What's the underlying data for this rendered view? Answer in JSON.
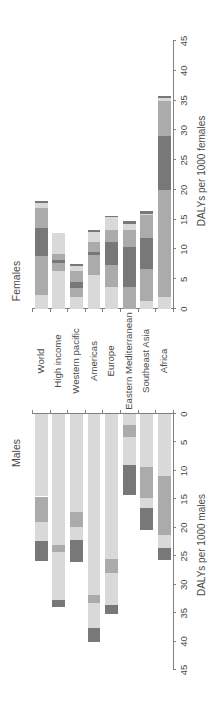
{
  "chart_data": {
    "type": "bar",
    "subtype": "stacked horizontal back-to-back (figure rotated 90 degrees)",
    "categories": [
      "World",
      "High income",
      "Western pacific",
      "Americas",
      "Europe",
      "Eastern Mediterranean",
      "Southeast Asia",
      "Africa"
    ],
    "shade_colors": {
      "light": "#d9d9d9",
      "medium": "#ababab",
      "dark": "#787878"
    },
    "grid": false,
    "legend": null,
    "panels": [
      {
        "name": "Females",
        "xlabel": "DALYs per 1000 females",
        "xlim": [
          0,
          45
        ],
        "ticks": [
          0,
          5,
          10,
          15,
          20,
          25,
          30,
          35,
          40,
          45
        ],
        "bars": [
          {
            "category": "World",
            "total": 18.2,
            "segments": [
              {
                "shade": "light",
                "value": 2.3
              },
              {
                "shade": "medium",
                "value": 6.6
              },
              {
                "shade": "dark",
                "value": 4.7
              },
              {
                "shade": "medium",
                "value": 3.4
              },
              {
                "shade": "light",
                "value": 0.8
              },
              {
                "shade": "dark",
                "value": 0.4
              }
            ]
          },
          {
            "category": "High income",
            "total": 12.7,
            "segments": [
              {
                "shade": "light",
                "value": 6.3
              },
              {
                "shade": "medium",
                "value": 1.5
              },
              {
                "shade": "dark",
                "value": 0.4
              },
              {
                "shade": "medium",
                "value": 1.0
              },
              {
                "shade": "light",
                "value": 3.5
              }
            ]
          },
          {
            "category": "Western pacific",
            "total": 7.55,
            "segments": [
              {
                "shade": "light",
                "value": 2.0
              },
              {
                "shade": "medium",
                "value": 1.5
              },
              {
                "shade": "dark",
                "value": 1.1
              },
              {
                "shade": "medium",
                "value": 1.7
              },
              {
                "shade": "light",
                "value": 0.9
              },
              {
                "shade": "dark",
                "value": 0.35
              }
            ]
          },
          {
            "category": "Americas",
            "total": 13.25,
            "segments": [
              {
                "shade": "light",
                "value": 5.7
              },
              {
                "shade": "medium",
                "value": 3.35
              },
              {
                "shade": "dark",
                "value": 0.45
              },
              {
                "shade": "medium",
                "value": 1.7
              },
              {
                "shade": "light",
                "value": 1.7
              },
              {
                "shade": "dark",
                "value": 0.35
              }
            ]
          },
          {
            "category": "Europe",
            "total": 15.65,
            "segments": [
              {
                "shade": "light",
                "value": 3.75
              },
              {
                "shade": "medium",
                "value": 3.65
              },
              {
                "shade": "dark",
                "value": 3.8
              },
              {
                "shade": "medium",
                "value": 2.1
              },
              {
                "shade": "light",
                "value": 2.1
              },
              {
                "shade": "dark",
                "value": 0.25
              }
            ]
          },
          {
            "category": "Eastern Mediterranean",
            "total": 14.7,
            "segments": [
              {
                "shade": "medium",
                "value": 3.75
              },
              {
                "shade": "dark",
                "value": 6.6
              },
              {
                "shade": "medium",
                "value": 2.9
              },
              {
                "shade": "light",
                "value": 1.0
              },
              {
                "shade": "dark",
                "value": 0.45
              }
            ]
          },
          {
            "category": "Southeast Asia",
            "total": 16.4,
            "segments": [
              {
                "shade": "light",
                "value": 1.4
              },
              {
                "shade": "medium",
                "value": 5.4
              },
              {
                "shade": "dark",
                "value": 5.05
              },
              {
                "shade": "medium",
                "value": 4.0
              },
              {
                "shade": "light",
                "value": 0.15
              },
              {
                "shade": "dark",
                "value": 0.4
              }
            ]
          },
          {
            "category": "Africa",
            "total": 35.7,
            "segments": [
              {
                "shade": "light",
                "value": 2.0
              },
              {
                "shade": "medium",
                "value": 18.0
              },
              {
                "shade": "dark",
                "value": 9.1
              },
              {
                "shade": "medium",
                "value": 5.85
              },
              {
                "shade": "light",
                "value": 0.45
              },
              {
                "shade": "dark",
                "value": 0.3
              }
            ]
          }
        ]
      },
      {
        "name": "Males",
        "xlabel": "DALYs per 1000 males",
        "xlim": [
          0,
          45
        ],
        "ticks": [
          0,
          5,
          10,
          15,
          20,
          25,
          30,
          35,
          40,
          45
        ],
        "bars": [
          {
            "category": "World",
            "total": 25.8,
            "segments": [
              {
                "shade": "light",
                "value": 14.5
              },
              {
                "shade": "medium",
                "value": 4.4
              },
              {
                "shade": "light",
                "value": 3.4
              },
              {
                "shade": "dark",
                "value": 3.5
              }
            ]
          },
          {
            "category": "High income",
            "total": 33.9,
            "segments": [
              {
                "shade": "light",
                "value": 23.0
              },
              {
                "shade": "medium",
                "value": 1.2
              },
              {
                "shade": "light",
                "value": 8.5
              },
              {
                "shade": "dark",
                "value": 1.2
              }
            ]
          },
          {
            "category": "Western pacific",
            "total": 26.1,
            "segments": [
              {
                "shade": "light",
                "value": 17.2
              },
              {
                "shade": "medium",
                "value": 2.7
              },
              {
                "shade": "light",
                "value": 2.2
              },
              {
                "shade": "dark",
                "value": 4.0
              }
            ]
          },
          {
            "category": "Americas",
            "total": 40.1,
            "segments": [
              {
                "shade": "light",
                "value": 31.9
              },
              {
                "shade": "medium",
                "value": 1.4
              },
              {
                "shade": "light",
                "value": 4.3
              },
              {
                "shade": "dark",
                "value": 2.5
              }
            ]
          },
          {
            "category": "Europe",
            "total": 35.2,
            "segments": [
              {
                "shade": "light",
                "value": 25.5
              },
              {
                "shade": "medium",
                "value": 2.5
              },
              {
                "shade": "light",
                "value": 5.5
              },
              {
                "shade": "dark",
                "value": 1.7
              }
            ]
          },
          {
            "category": "Eastern Mediterranean",
            "total": 14.2,
            "segments": [
              {
                "shade": "light",
                "value": 1.9
              },
              {
                "shade": "medium",
                "value": 2.1
              },
              {
                "shade": "light",
                "value": 5.0
              },
              {
                "shade": "dark",
                "value": 5.2
              }
            ]
          },
          {
            "category": "Southeast Asia",
            "total": 20.4,
            "segments": [
              {
                "shade": "light",
                "value": 9.4
              },
              {
                "shade": "medium",
                "value": 5.3
              },
              {
                "shade": "light",
                "value": 1.8
              },
              {
                "shade": "dark",
                "value": 3.9
              }
            ]
          },
          {
            "category": "Africa",
            "total": 25.7,
            "segments": [
              {
                "shade": "light",
                "value": 10.9
              },
              {
                "shade": "medium",
                "value": 10.4
              },
              {
                "shade": "light",
                "value": 2.3
              },
              {
                "shade": "dark",
                "value": 2.1
              }
            ]
          }
        ]
      }
    ]
  }
}
